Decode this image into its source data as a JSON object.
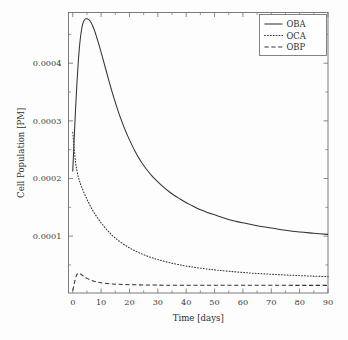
{
  "chart_data": {
    "type": "line",
    "title": "",
    "xlabel": "Time [days]",
    "ylabel": "Cell Population [PM]",
    "xlim": [
      -1.5,
      90
    ],
    "ylim": [
      1.3e-06,
      0.000488
    ],
    "grid": false,
    "legend_position": "top-right",
    "x_ticks": [
      0,
      10,
      20,
      30,
      40,
      50,
      60,
      70,
      80,
      90
    ],
    "x_tick_labels": [
      "0",
      "10",
      "20",
      "30",
      "40",
      "50",
      "60",
      "70",
      "80",
      "90"
    ],
    "x_minor_ticks": [
      5,
      15,
      25,
      35,
      45,
      55,
      65,
      75,
      85
    ],
    "y_ticks": [
      0.0001,
      0.0002,
      0.0003,
      0.0004
    ],
    "y_tick_labels": [
      "0.0001",
      "0.0002",
      "0.0003",
      "0.0004"
    ],
    "y_minor_ticks": [
      5e-05,
      0.00015,
      0.00025,
      0.00035,
      0.00045
    ],
    "series": [
      {
        "name": "OBA",
        "style": "solid",
        "color": "#333333",
        "x": [
          0,
          0.5,
          1,
          1.5,
          2,
          2.5,
          3,
          3.5,
          4,
          4.5,
          5,
          5.5,
          6,
          6.5,
          7,
          7.5,
          8,
          9,
          10,
          11,
          12,
          13,
          14,
          15,
          16,
          17,
          18,
          19,
          20,
          22,
          24,
          26,
          28,
          30,
          32,
          34,
          36,
          38,
          40,
          42,
          44,
          46,
          48,
          50,
          55,
          60,
          65,
          70,
          75,
          80,
          85,
          90
        ],
        "y": [
          0.000212,
          0.000268,
          0.000322,
          0.000368,
          0.000406,
          0.000435,
          0.000455,
          0.000468,
          0.000474,
          0.000477,
          0.000477,
          0.000476,
          0.000474,
          0.00047,
          0.000465,
          0.000459,
          0.000452,
          0.000436,
          0.000419,
          0.000401,
          0.000383,
          0.000365,
          0.000348,
          0.000332,
          0.000317,
          0.000303,
          0.00029,
          0.000278,
          0.000267,
          0.000247,
          0.00023,
          0.000216,
          0.000204,
          0.000194,
          0.000185,
          0.000177,
          0.00017,
          0.000164,
          0.000158,
          0.000153,
          0.000148,
          0.000144,
          0.00014,
          0.000137,
          0.000129,
          0.000123,
          0.000118,
          0.000114,
          0.00011,
          0.000107,
          0.000105,
          0.000103
        ]
      },
      {
        "name": "OCA",
        "style": "dotted",
        "color": "#333333",
        "x": [
          0,
          0.5,
          1,
          1.5,
          2,
          2.5,
          3,
          4,
          5,
          6,
          7,
          8,
          9,
          10,
          11,
          12,
          13,
          14,
          15,
          16,
          18,
          20,
          22,
          24,
          26,
          28,
          30,
          33,
          36,
          39,
          42,
          45,
          48,
          51,
          55,
          60,
          65,
          70,
          75,
          80,
          85,
          90
        ],
        "y": [
          0.00028,
          0.000252,
          0.000228,
          0.000213,
          0.000202,
          0.000194,
          0.000187,
          0.000175,
          0.000164,
          0.000154,
          0.000145,
          0.000137,
          0.00013,
          0.000123,
          0.000117,
          0.000111,
          0.000106,
          0.000101,
          9.67e-05,
          9.27e-05,
          8.56e-05,
          7.96e-05,
          7.44e-05,
          6.98e-05,
          6.59e-05,
          6.24e-05,
          5.93e-05,
          5.53e-05,
          5.19e-05,
          4.9e-05,
          4.65e-05,
          4.44e-05,
          4.25e-05,
          4.09e-05,
          3.9e-05,
          3.69e-05,
          3.52e-05,
          3.38e-05,
          3.26e-05,
          3.15e-05,
          3.05e-05,
          2.97e-05
        ]
      },
      {
        "name": "OBP",
        "style": "dashed",
        "color": "#333333",
        "x": [
          0,
          0.4,
          0.8,
          1.2,
          1.6,
          2,
          2.4,
          2.8,
          3.2,
          3.6,
          4,
          5,
          6,
          7,
          8,
          9,
          10,
          12,
          14,
          16,
          18,
          20,
          23,
          26,
          29,
          32,
          35,
          40,
          45,
          50,
          55,
          60,
          65,
          70,
          75,
          80,
          85,
          90
        ],
        "y": [
          5.5e-06,
          1.45e-05,
          2.35e-05,
          3.05e-05,
          3.45e-05,
          3.57e-05,
          3.52e-05,
          3.4e-05,
          3.26e-05,
          3.12e-05,
          2.98e-05,
          2.67e-05,
          2.43e-05,
          2.25e-05,
          2.11e-05,
          2e-05,
          1.91e-05,
          1.78e-05,
          1.7e-05,
          1.64e-05,
          1.6e-05,
          1.57e-05,
          1.54e-05,
          1.52e-05,
          1.5e-05,
          1.49e-05,
          1.48e-05,
          1.47e-05,
          1.47e-05,
          1.46e-05,
          1.46e-05,
          1.46e-05,
          1.46e-05,
          1.46e-05,
          1.46e-05,
          1.45e-05,
          1.45e-05,
          1.45e-05
        ]
      }
    ]
  },
  "legend": {
    "items": [
      {
        "label": "OBA",
        "style": "solid"
      },
      {
        "label": "OCA",
        "style": "dotted"
      },
      {
        "label": "OBP",
        "style": "dashed"
      }
    ]
  },
  "axes": {
    "x_title": "Time [days]",
    "y_title": "Cell Population [PM]"
  }
}
